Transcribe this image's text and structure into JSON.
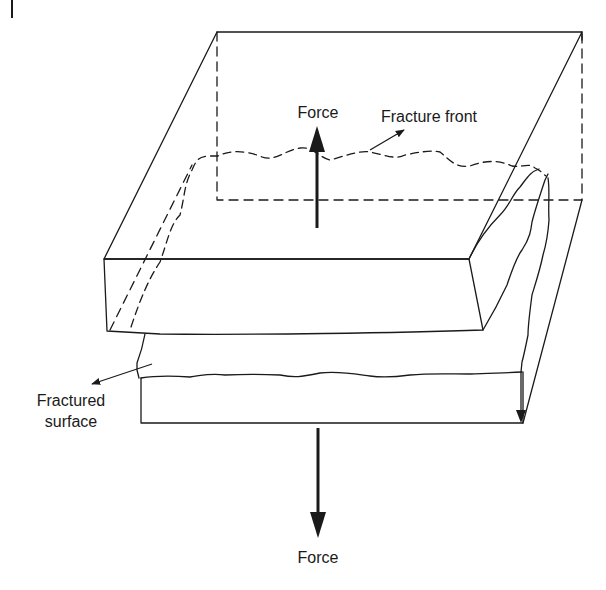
{
  "diagram": {
    "type": "fracture-schematic",
    "colors": {
      "background": "#ffffff",
      "line": "#1a1a1a"
    },
    "labels": {
      "force_top": "Force",
      "fracture_front": "Fracture front",
      "fractured_surface_line1": "Fractured",
      "fractured_surface_line2": "surface",
      "force_bottom": "Force"
    },
    "elements": [
      {
        "id": "upper-block",
        "kind": "solid-block",
        "role": "separated upper half"
      },
      {
        "id": "lower-block",
        "kind": "solid-block",
        "role": "lower half"
      },
      {
        "id": "fracture-front-line",
        "kind": "dashed-wavy-line"
      },
      {
        "id": "force-up-arrow",
        "kind": "arrow",
        "direction": "up"
      },
      {
        "id": "force-down-arrow",
        "kind": "arrow",
        "direction": "down"
      },
      {
        "id": "fracture-front-pointer",
        "kind": "arrow"
      },
      {
        "id": "fractured-surface-pointer",
        "kind": "arrow"
      }
    ]
  }
}
